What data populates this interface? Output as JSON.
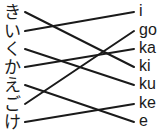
{
  "diagram": {
    "type": "matching-lines",
    "left_items": [
      "き",
      "い",
      "く",
      "か",
      "え",
      "ご",
      "け"
    ],
    "right_items": [
      "i",
      "go",
      "ka",
      "ki",
      "ku",
      "ke",
      "e"
    ],
    "row_y": [
      12,
      31,
      49,
      67,
      85,
      104,
      122
    ],
    "line_x": {
      "left": 25,
      "right": 134
    },
    "line_color": "#1a1a1a",
    "connections": [
      {
        "from": "き",
        "to": "ki"
      },
      {
        "from": "い",
        "to": "i"
      },
      {
        "from": "く",
        "to": "ku"
      },
      {
        "from": "か",
        "to": "ka"
      },
      {
        "from": "え",
        "to": "e"
      },
      {
        "from": "ご",
        "to": "go"
      },
      {
        "from": "け",
        "to": "ke"
      }
    ]
  }
}
